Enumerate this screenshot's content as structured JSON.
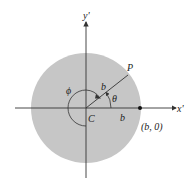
{
  "diagram": {
    "disk": {
      "cx": 86,
      "cy": 108,
      "r": 55,
      "color": "#c6c6c6"
    },
    "axes": {
      "x_label": "x'",
      "y_label": "y'",
      "color": "#333333"
    },
    "labels": {
      "center": "C",
      "point": "P",
      "radius_on_segment": "b",
      "radius_on_axis": "b",
      "theta": "θ",
      "phi": "ϕ",
      "point_coordinates": "(b, 0)"
    },
    "angles": {
      "theta_deg": 32,
      "phi_description": "large angle sweeping from segment CP counterclockwise around to negative y' axis"
    }
  }
}
